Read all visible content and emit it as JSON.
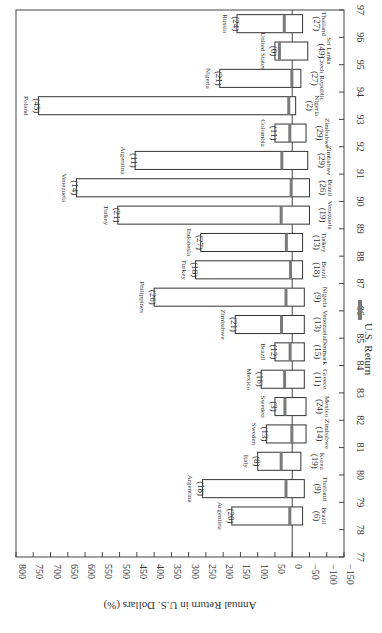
{
  "chart_data": {
    "type": "bar",
    "orientation": "rotated-90-clockwise",
    "title": "",
    "xlabel": "",
    "ylabel": "Annual Return in U.S. Dollars (%)",
    "ylim": [
      -150,
      800
    ],
    "yticks": [
      800,
      750,
      700,
      650,
      600,
      550,
      500,
      450,
      400,
      350,
      300,
      250,
      200,
      150,
      100,
      50,
      0,
      -50,
      -100,
      -150
    ],
    "ytick_labels": [
      "800",
      "750",
      "700",
      "650",
      "600",
      "550",
      "500",
      "450",
      "400",
      "350",
      "300",
      "250",
      "200",
      "150",
      "100",
      "50",
      "0",
      "−50",
      "−100",
      "−150"
    ],
    "xticks": [
      "77",
      "78",
      "79",
      "80",
      "81",
      "82",
      "83",
      "84",
      "85",
      "86",
      "87",
      "88",
      "89",
      "90",
      "91",
      "92",
      "93",
      "94",
      "95",
      "96",
      "97"
    ],
    "grid": false,
    "legend": {
      "position": "bottom-right",
      "entries": [
        {
          "name": "U.S. Return",
          "color": "#7a7a7a"
        }
      ]
    },
    "categories": [
      "78",
      "79",
      "80",
      "81",
      "82",
      "83",
      "84",
      "85",
      "86",
      "87",
      "88",
      "89",
      "90",
      "91",
      "92",
      "93",
      "94",
      "95",
      "96"
    ],
    "series": [
      {
        "name": "Best market return",
        "values": [
          175,
          260,
          100,
          75,
          50,
          90,
          50,
          165,
          400,
          280,
          265,
          505,
          625,
          455,
          50,
          735,
          210,
          50,
          160
        ]
      },
      {
        "name": "Worst market return",
        "values": [
          -30,
          -35,
          -25,
          -40,
          -40,
          -35,
          -35,
          -35,
          -35,
          -30,
          -30,
          -50,
          -50,
          -45,
          -40,
          -10,
          -25,
          -45,
          -30
        ]
      },
      {
        "name": "U.S. Return",
        "values": [
          7,
          18,
          32,
          1,
          21,
          22,
          6,
          31,
          18,
          5,
          17,
          32,
          3,
          30,
          7,
          10,
          1,
          37,
          23
        ]
      }
    ],
    "best_markets": [
      {
        "year": "78",
        "country": "Argentina",
        "rank": "(20)"
      },
      {
        "year": "79",
        "country": "Argentina",
        "rank": "(18)"
      },
      {
        "year": "80",
        "country": "Italy",
        "rank": "(8)"
      },
      {
        "year": "81",
        "country": "Sweden",
        "rank": "(13)"
      },
      {
        "year": "82",
        "country": "Sweden",
        "rank": "(3)"
      },
      {
        "year": "83",
        "country": "Mexico",
        "rank": "(16)"
      },
      {
        "year": "84",
        "country": "Brazil",
        "rank": "(12)"
      },
      {
        "year": "85",
        "country": "Zimbabwe",
        "rank": "(21)"
      },
      {
        "year": "86",
        "country": "Philippines",
        "rank": "(26)"
      },
      {
        "year": "87",
        "country": "Turkey",
        "rank": "(18)"
      },
      {
        "year": "88",
        "country": "Indonesia",
        "rank": "(27)"
      },
      {
        "year": "89",
        "country": "Turkey",
        "rank": "(21)"
      },
      {
        "year": "90",
        "country": "Venezuela",
        "rank": "(14)"
      },
      {
        "year": "91",
        "country": "Argentina",
        "rank": "(11)"
      },
      {
        "year": "92",
        "country": "Colombia",
        "rank": "(11)"
      },
      {
        "year": "93",
        "country": "Poland",
        "rank": "(45)"
      },
      {
        "year": "94",
        "country": "Nigeria",
        "rank": "(21)"
      },
      {
        "year": "95",
        "country": "United States",
        "rank": "(0)"
      },
      {
        "year": "96",
        "country": "Russia",
        "rank": "(24)"
      }
    ],
    "worst_markets": [
      {
        "year": "78",
        "country": "Brazil",
        "rank": "(6)"
      },
      {
        "year": "79",
        "country": "Thailand",
        "rank": "(9)"
      },
      {
        "year": "80",
        "country": "Korea",
        "rank": "(19)"
      },
      {
        "year": "81",
        "country": "Zimbabwe",
        "rank": "(14)"
      },
      {
        "year": "82",
        "country": "Mexico",
        "rank": "(24)"
      },
      {
        "year": "83",
        "country": "Greece",
        "rank": "(11)"
      },
      {
        "year": "84",
        "country": "Denmark",
        "rank": "(15)"
      },
      {
        "year": "85",
        "country": "Venezuela",
        "rank": "(13)"
      },
      {
        "year": "86",
        "country": "Nigeria",
        "rank": "(9)"
      },
      {
        "year": "87",
        "country": "Brazil",
        "rank": "(18)"
      },
      {
        "year": "88",
        "country": "Turkey",
        "rank": "(13)"
      },
      {
        "year": "89",
        "country": "Venezuela",
        "rank": "(19)"
      },
      {
        "year": "90",
        "country": "Brazil",
        "rank": "(26)"
      },
      {
        "year": "91",
        "country": "Zimbabwe",
        "rank": "(29)"
      },
      {
        "year": "92",
        "country": "Zimbabwe",
        "rank": "(29)"
      },
      {
        "year": "93",
        "country": "Nigeria",
        "rank": "(2)"
      },
      {
        "year": "94",
        "country": "Czech Republic",
        "rank": "(27)"
      },
      {
        "year": "95",
        "country": "Sri Lanka",
        "rank": "(49)"
      },
      {
        "year": "96",
        "country": "Thailand",
        "rank": "(27)"
      }
    ]
  }
}
